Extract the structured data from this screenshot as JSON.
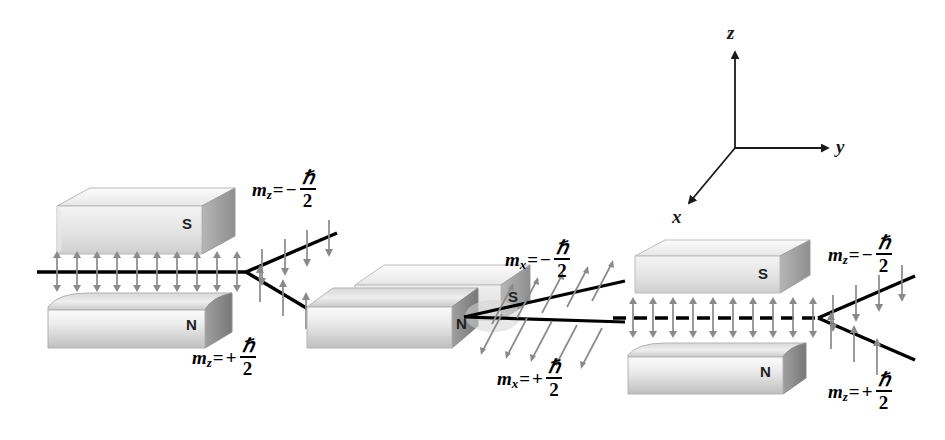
{
  "figure": {
    "background_color": "#ffffff",
    "ink_color": "#000000",
    "magnet_light": "#f2f2f2",
    "magnet_mid": "#d0d0d0",
    "magnet_dark": "#8c8c8c",
    "arrow_color": "#8a8a8a"
  },
  "axes": {
    "label_z": "z",
    "label_y": "y",
    "label_x": "x",
    "origin": {
      "x": 735,
      "y": 148
    }
  },
  "stages": [
    {
      "id": "stage-1",
      "orientation": "z",
      "upper_pole": "S",
      "lower_pole": "N",
      "beam_style": "solid",
      "beam_arrows": "vertical-double",
      "outputs": [
        {
          "branch": "upper",
          "label": {
            "m": "m",
            "sub": "z",
            "eq": "=",
            "sign": "−",
            "num": "ℏ",
            "den": "2"
          },
          "arrow_dir": "down"
        },
        {
          "branch": "lower",
          "label": {
            "m": "m",
            "sub": "z",
            "eq": "=",
            "sign": "+",
            "num": "ℏ",
            "den": "2"
          },
          "arrow_dir": "up"
        }
      ]
    },
    {
      "id": "stage-2",
      "orientation": "x",
      "upper_pole": "S",
      "lower_pole": "N",
      "beam_style": "solid",
      "beam_arrows": "vertical-up",
      "outputs": [
        {
          "branch": "upper",
          "label": {
            "m": "m",
            "sub": "x",
            "eq": "=",
            "sign": "−",
            "num": "ℏ",
            "den": "2"
          },
          "arrow_dir": "diagonal"
        },
        {
          "branch": "lower",
          "label": {
            "m": "m",
            "sub": "x",
            "eq": "=",
            "sign": "+",
            "num": "ℏ",
            "den": "2"
          },
          "arrow_dir": "diagonal"
        }
      ]
    },
    {
      "id": "stage-3",
      "orientation": "z",
      "upper_pole": "S",
      "lower_pole": "N",
      "beam_style": "dashed",
      "beam_arrows": "vertical-double",
      "outputs": [
        {
          "branch": "upper",
          "label": {
            "m": "m",
            "sub": "z",
            "eq": "=",
            "sign": "−",
            "num": "ℏ",
            "den": "2"
          },
          "arrow_dir": "down"
        },
        {
          "branch": "lower",
          "label": {
            "m": "m",
            "sub": "z",
            "eq": "=",
            "sign": "+",
            "num": "ℏ",
            "den": "2"
          },
          "arrow_dir": "up"
        }
      ]
    }
  ],
  "labels": {
    "stage1_upper": {
      "m": "m",
      "sub": "z",
      "eq": "=",
      "sign": "−",
      "num": "ℏ",
      "den": "2"
    },
    "stage1_lower": {
      "m": "m",
      "sub": "z",
      "eq": "=",
      "sign": "+",
      "num": "ℏ",
      "den": "2"
    },
    "stage2_upper": {
      "m": "m",
      "sub": "x",
      "eq": "=",
      "sign": "−",
      "num": "ℏ",
      "den": "2"
    },
    "stage2_lower": {
      "m": "m",
      "sub": "x",
      "eq": "=",
      "sign": "+",
      "num": "ℏ",
      "den": "2"
    },
    "stage3_upper": {
      "m": "m",
      "sub": "z",
      "eq": "=",
      "sign": "−",
      "num": "ℏ",
      "den": "2"
    },
    "stage3_lower": {
      "m": "m",
      "sub": "z",
      "eq": "=",
      "sign": "+",
      "num": "ℏ",
      "den": "2"
    }
  },
  "poles": {
    "s1": "S",
    "n1": "N",
    "s2": "S",
    "n2": "N",
    "s3": "S",
    "n3": "N"
  }
}
